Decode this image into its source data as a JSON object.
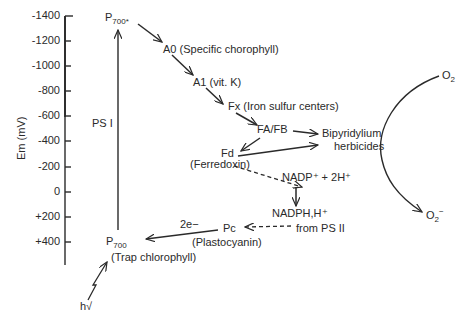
{
  "axis": {
    "label": "Em (mV)",
    "ticks": [
      "-1400",
      "-1200",
      "-1000",
      "-800",
      "-600",
      "-400",
      "-200",
      "0",
      "+200",
      "+400"
    ]
  },
  "nodes": {
    "p700_star": {
      "main": "P",
      "sub": "700*"
    },
    "a0": "A0 (Specific chorophyll)",
    "a1": "A1 (vit. K)",
    "fx": "Fx (Iron sulfur centers)",
    "fafb": "FA/FB",
    "bipyridylium_line1": "Bipyridylium",
    "bipyridylium_line2": "herbicides",
    "fd": "Fd",
    "fd_desc": "(Ferredoxin)",
    "nadp": "NADP⁺ + 2H⁺",
    "nadph": "NADPH,H⁺",
    "from_ps2": "from PS II",
    "pc": "Pc",
    "pc_desc": "(Plastocyanin)",
    "two_e": "2e−",
    "p700": {
      "main": "P",
      "sub": "700"
    },
    "p700_desc": "(Trap chlorophyll)",
    "ps1": "PS I",
    "hv": "h√",
    "o2": {
      "main": "O",
      "sub": "2"
    },
    "o2_minus": {
      "main": "O",
      "sub": "2",
      "sup": "−"
    }
  },
  "colors": {
    "ink": "#2a2a2a",
    "background": "#ffffff"
  }
}
